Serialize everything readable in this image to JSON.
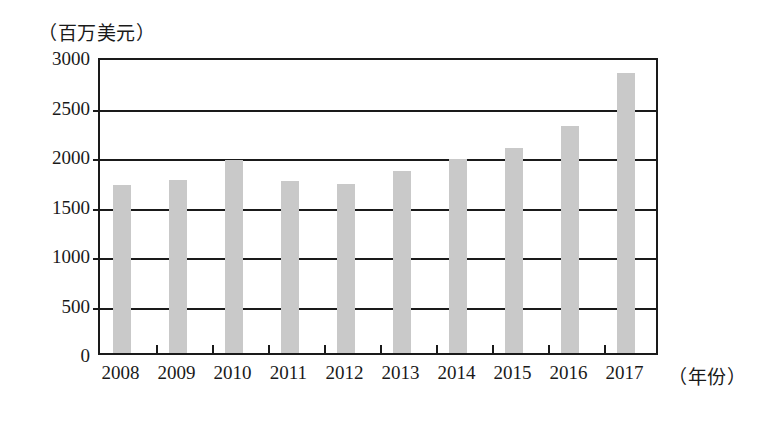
{
  "chart_data": {
    "type": "bar",
    "title": "",
    "subtitle": "",
    "unit_caption": "（百万美元）",
    "xlabel": "（年份）",
    "ylabel": "",
    "categories": [
      "2008",
      "2009",
      "2010",
      "2011",
      "2012",
      "2013",
      "2014",
      "2015",
      "2016",
      "2017"
    ],
    "values": [
      1700,
      1750,
      1950,
      1740,
      1710,
      1840,
      1960,
      2070,
      2290,
      2830
    ],
    "series": [
      {
        "name": "金额",
        "values": [
          1700,
          1750,
          1950,
          1740,
          1710,
          1840,
          1960,
          2070,
          2290,
          2830
        ]
      }
    ],
    "ylim": [
      0,
      3000
    ],
    "y_ticks": [
      0,
      500,
      1000,
      1500,
      2000,
      2500,
      3000
    ],
    "y_tick_labels": [
      "0",
      "500",
      "1000",
      "1500",
      "2000",
      "2500",
      "3000"
    ],
    "grid": true,
    "grid_axis": "y",
    "legend": false,
    "legend_position": "none",
    "bar_color": "#c9c9c9",
    "axis_color": "#1a1a1a",
    "background_color": "#ffffff"
  }
}
